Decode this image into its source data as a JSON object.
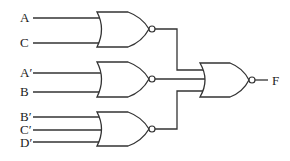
{
  "diagram": {
    "type": "logic-circuit",
    "gate_type": "NOR",
    "inputs": {
      "gate1": [
        "A",
        "C"
      ],
      "gate2": [
        "A′",
        "B"
      ],
      "gate3": [
        "B′",
        "C′",
        "D′"
      ]
    },
    "labels": {
      "a": "A",
      "c": "C",
      "a_prime": "A′",
      "b": "B",
      "b_prime": "B′",
      "c_prime": "C′",
      "d_prime": "D′",
      "output": "F"
    },
    "output_gate_inputs": [
      "gate1",
      "gate2",
      "gate3"
    ]
  }
}
